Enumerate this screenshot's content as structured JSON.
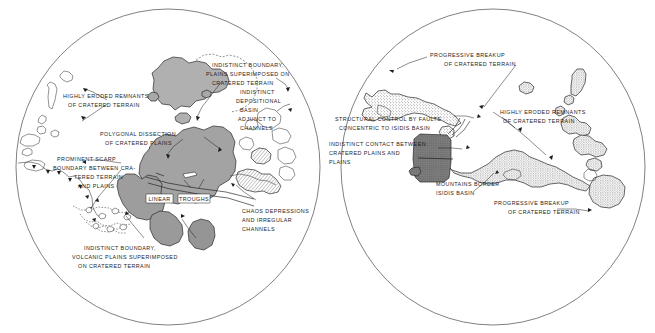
{
  "figure": {
    "type": "map",
    "colors": {
      "page_background": "#ffffff",
      "ink": "#1c1c1c",
      "limb_outline": "#4a4a4a",
      "plains_fill_light": "#b4b4b4",
      "plains_fill_mid": "#a3a3a3",
      "plains_fill_dark": "#8c8c8c",
      "isidis_basin_fill": "#767676",
      "stipple_fill": "#c9c9c9"
    }
  },
  "left_hemisphere": {
    "name": "left-hemisphere-map",
    "labels": [
      {
        "id": "indistinct-boundary-plains",
        "lines": [
          "INDISTINCT BOUNDARY,",
          "PLAINS SUPERIMPOSED ON",
          "CRATERED TERRAIN"
        ]
      },
      {
        "id": "indistinct-depositional-basin",
        "lines": [
          "INDISTINCT",
          "DEPOSITIONAL",
          "BASIN",
          "ADJUNCT TO",
          "CHANNELS"
        ]
      },
      {
        "id": "highly-eroded-remnants",
        "lines": [
          "HIGHLY ERODED REMNANTS",
          "OF CRATERED TERRAIN"
        ]
      },
      {
        "id": "polygonal-dissection",
        "lines": [
          "POLYGONAL DISSECTION",
          "OF CRATERED PLAINS"
        ]
      },
      {
        "id": "prominent-scarp",
        "lines": [
          "PROMINENT SCARP",
          "BOUNDARY BETWEEN CRA-",
          "TERED TERRAIN",
          "AND PLAINS"
        ]
      },
      {
        "id": "chaos-depressions",
        "lines": [
          "CHAOS DEPRESSIONS",
          "AND IRREGULAR",
          "CHANNELS"
        ]
      },
      {
        "id": "indistinct-boundary-volcanic",
        "lines": [
          "INDISTINCT BOUNDARY,",
          "VOLCANIC PLAINS SUPERIMPOSED",
          "ON CRATERED TERRAIN"
        ]
      }
    ],
    "boxed_labels": [
      {
        "id": "linear-box",
        "text": "LINEAR"
      },
      {
        "id": "troughs-box",
        "text": "TROUGHS"
      }
    ]
  },
  "right_hemisphere": {
    "name": "right-hemisphere-map",
    "labels": [
      {
        "id": "progressive-breakup-top",
        "lines": [
          "PROGRESSIVE BREAKUP",
          "OF CRATERED TERRAIN"
        ]
      },
      {
        "id": "structural-control-faults",
        "lines": [
          "STRUCTURAL CONTROL BY FAULTS",
          "CONCENTRIC TO ISIDIS BASIN"
        ]
      },
      {
        "id": "indistinct-contact",
        "lines": [
          "INDISTINCT CONTACT BETWEEN",
          "CRATERED PLAINS AND",
          "PLAINS"
        ]
      },
      {
        "id": "highly-eroded-remnants-right",
        "lines": [
          "HIGHLY ERODED REMNANTS",
          "OF CRATERED TERRAIN"
        ]
      },
      {
        "id": "mountains-border-isidis",
        "lines": [
          "MOUNTAINS BORDER",
          "ISIDIS BASIN"
        ]
      },
      {
        "id": "progressive-breakup-bottom",
        "lines": [
          "PROGRESSIVE BREAKUP",
          "OF CRATERED TERRAIN"
        ]
      }
    ]
  }
}
